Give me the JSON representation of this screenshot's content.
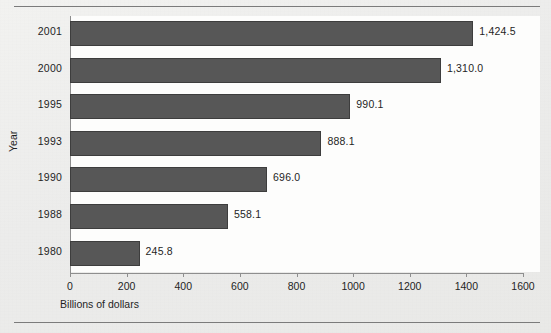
{
  "chart_data": {
    "type": "bar",
    "orientation": "horizontal",
    "title": "",
    "xlabel": "Billions of dollars",
    "ylabel": "Year",
    "categories": [
      "2001",
      "2000",
      "1995",
      "1993",
      "1990",
      "1988",
      "1980"
    ],
    "values": [
      1424.5,
      1310.0,
      990.1,
      888.1,
      696.0,
      558.1,
      245.8
    ],
    "value_labels": [
      "1,424.5",
      "1,310.0",
      "990.1",
      "888.1",
      "696.0",
      "558.1",
      "245.8"
    ],
    "xlim": [
      0,
      1600
    ],
    "xticks": [
      0,
      200,
      400,
      600,
      800,
      1000,
      1200,
      1400,
      1600
    ],
    "xtick_labels": [
      "0",
      "200",
      "400",
      "600",
      "800",
      "1000",
      "1200",
      "1400",
      "1600"
    ],
    "xtick_last_clipped_text": "160",
    "grid": false,
    "legend": false,
    "bar_color": "#575757",
    "bar_edge_color": "#3d3d3d",
    "axis_color": "#8e8e8e",
    "plot_background": "#fdfdfc",
    "page_background": "#eeeeec",
    "text_color": "#1f1f1f"
  }
}
